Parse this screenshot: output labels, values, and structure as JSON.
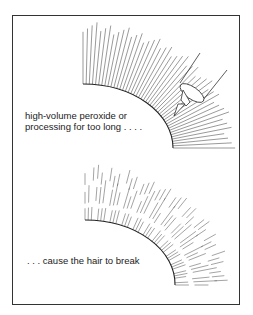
{
  "figure": {
    "panels": [
      {
        "id": "top",
        "caption_line1": "high-volume peroxide or",
        "caption_line2": "processing for too long . . . .",
        "illustration": "hair-strands-with-applicator"
      },
      {
        "id": "bottom",
        "caption_line1": ". . . cause the hair to break",
        "illustration": "broken-hair-strands"
      }
    ],
    "colors": {
      "line": "#333333",
      "frame": "#333333",
      "background": "#ffffff"
    }
  }
}
